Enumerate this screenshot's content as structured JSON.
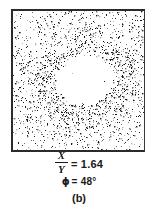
{
  "figure": {
    "panel_label": "(b)",
    "caption": {
      "ratio_numerator": "X",
      "ratio_denominator": "Y",
      "ratio_equals": "= 1.64",
      "ratio_value": 1.64,
      "phi_symbol": "ϕ",
      "phi_equals": "= 48°",
      "phi_value": 48,
      "phi_unit": "degrees"
    }
  },
  "colors": {
    "background": "#ffffff",
    "frame_border": "#2b2b2b",
    "dot_dark": "#1a1a1a",
    "dot_mid": "#6e6e6e",
    "dot_light": "#b4b4b4",
    "text": "#1a1a1a"
  },
  "chart_data": {
    "type": "scatter",
    "title": "",
    "subtitle": "",
    "xlabel": "",
    "ylabel": "",
    "xlim": [
      0,
      131
    ],
    "ylim": [
      0,
      139
    ],
    "grid": false,
    "legend": null,
    "axis_ticks": false,
    "point_count": 5200,
    "void": {
      "shape": "ellipse",
      "center_x": 72,
      "center_y": 68,
      "radius_x": 30,
      "radius_y": 26,
      "rotation_deg": -18
    },
    "ring": {
      "shape": "ellipse-annulus",
      "center_x": 72,
      "center_y": 68,
      "inner_radius_x": 30,
      "inner_radius_y": 26,
      "outer_radius_x": 52,
      "outer_radius_y": 47,
      "rotation_deg": -18,
      "density_multiplier": 2.3
    },
    "background_density": 0.33,
    "annotations": [
      {
        "text": "X/Y = 1.64",
        "position": "below-axes"
      },
      {
        "text": "ϕ = 48°",
        "position": "below-axes"
      },
      {
        "text": "(b)",
        "position": "below-axes"
      }
    ]
  }
}
